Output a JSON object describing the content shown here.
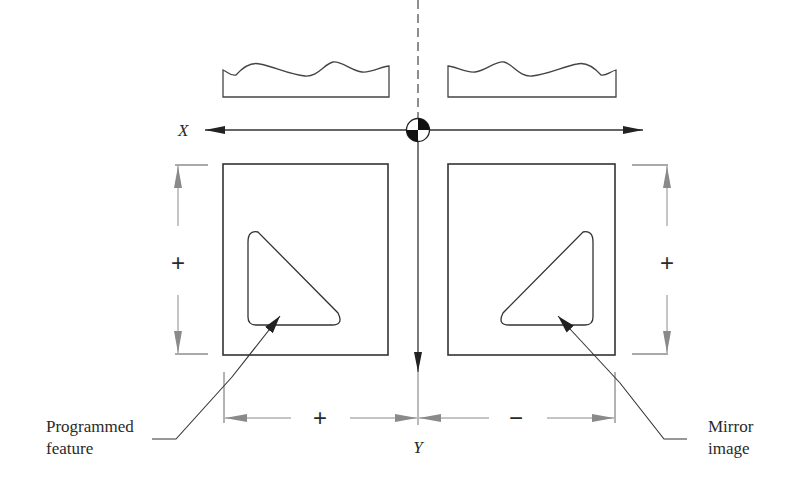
{
  "diagram": {
    "axes": {
      "x_label": "X",
      "y_label": "Y"
    },
    "dimensions": {
      "left_vertical_sign": "+",
      "right_vertical_sign": "+",
      "bottom_left_sign": "+",
      "bottom_right_sign": "−"
    },
    "callouts": {
      "left": {
        "line1": "Programmed",
        "line2": "feature"
      },
      "right": {
        "line1": "Mirror",
        "line2": "image"
      }
    },
    "colors": {
      "line": "#333333",
      "dimension": "#8a8a8a",
      "background": "#ffffff"
    }
  }
}
